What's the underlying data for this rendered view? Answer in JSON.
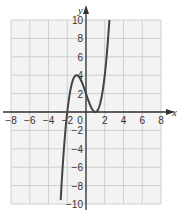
{
  "chart_data": {
    "type": "line",
    "title": "",
    "xlabel": "x",
    "ylabel": "y",
    "xlim": [
      -8,
      8
    ],
    "ylim": [
      -10,
      10
    ],
    "grid": true,
    "grid_step": 2,
    "x_ticks": [
      -8,
      -6,
      -4,
      -2,
      0,
      2,
      4,
      6,
      8
    ],
    "y_ticks": [
      -10,
      -8,
      -6,
      -4,
      -2,
      2,
      4,
      6,
      8,
      10
    ],
    "x_tick_labels": [
      "−8",
      "−6",
      "−4",
      "−2",
      "0",
      "2",
      "4",
      "6",
      "8"
    ],
    "y_tick_labels": [
      "−10",
      "−8",
      "−6",
      "−4",
      "−2",
      "2",
      "4",
      "6",
      "8",
      "10"
    ],
    "series": [
      {
        "name": "cubic curve",
        "description": "Cubic with local maximum near (-1, 4), local minimum touching x-axis at (1, 0), y-intercept 2, x-intercept -2",
        "x": [
          -2.7,
          -2.5,
          -2.0,
          -1.5,
          -1.0,
          -0.5,
          0.0,
          0.5,
          1.0,
          1.5,
          2.0,
          2.5
        ],
        "y": [
          -9.6,
          -5.6,
          0.0,
          3.1,
          4.0,
          3.4,
          2.0,
          0.6,
          0.0,
          0.9,
          4.0,
          10.1
        ]
      }
    ],
    "colors": {
      "background": "#f3f3f3",
      "grid": "#cfcfcf",
      "axis": "#333333",
      "curve": "#444444"
    }
  },
  "labels": {
    "x_axis": "x",
    "y_axis": "y",
    "origin": "0"
  }
}
